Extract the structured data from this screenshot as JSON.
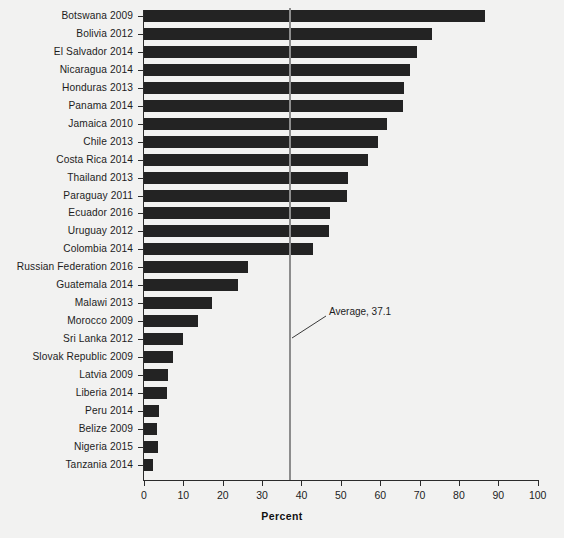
{
  "chart_data": {
    "type": "bar",
    "orientation": "horizontal",
    "title": "",
    "xlabel": "Percent",
    "ylabel": "",
    "xlim": [
      0,
      100
    ],
    "xticks": [
      0,
      10,
      20,
      30,
      40,
      50,
      60,
      70,
      80,
      90,
      100
    ],
    "grid": false,
    "legend": null,
    "bar_color": "#232323",
    "background_color": "#f2f2f1",
    "categories": [
      "Botswana 2009",
      "Bolivia 2012",
      "El Salvador 2014",
      "Nicaragua 2014",
      "Honduras 2013",
      "Panama 2014",
      "Jamaica 2010",
      "Chile 2013",
      "Costa Rica 2014",
      "Thailand 2013",
      "Paraguay 2011",
      "Ecuador 2016",
      "Uruguay 2012",
      "Colombia 2014",
      "Russian Federation 2016",
      "Guatemala 2014",
      "Malawi 2013",
      "Morocco 2009",
      "Sri Lanka 2012",
      "Slovak Republic 2009",
      "Latvia 2009",
      "Liberia 2014",
      "Peru 2014",
      "Belize 2009",
      "Nigeria 2015",
      "Tanzania 2014"
    ],
    "values": [
      86.6,
      73.2,
      69.4,
      67.6,
      66.0,
      65.8,
      61.7,
      59.4,
      56.8,
      51.9,
      51.6,
      47.2,
      47.0,
      42.9,
      26.5,
      23.9,
      17.2,
      13.8,
      9.8,
      7.4,
      6.1,
      5.9,
      3.8,
      3.4,
      3.5,
      2.3
    ],
    "annotations": [
      {
        "name": "average-line",
        "label": "Average, 37.1",
        "value": 37.1,
        "color": "#8d8d8d"
      }
    ]
  }
}
